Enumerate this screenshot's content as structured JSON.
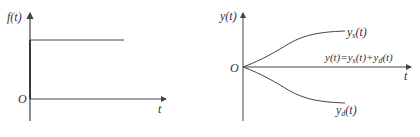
{
  "left_plot": {
    "y_label": "f(t)",
    "x_label": "t",
    "origin_label": "O",
    "description": "step input: constant value for t > 0"
  },
  "right_plot": {
    "y_label": "y(t)",
    "x_label": "t",
    "origin_label": "O",
    "curve_upper": {
      "base": "y",
      "sub": "s",
      "tail": "(t)"
    },
    "curve_lower": {
      "base": "y",
      "sub": "d",
      "tail": "(t)"
    },
    "sum_label": {
      "lhs": "y(t)=y",
      "sub1": "s",
      "mid": "(t)+y",
      "sub2": "d",
      "tail": "(t)"
    }
  },
  "colors": {
    "line": "#444444",
    "text": "#333333"
  }
}
